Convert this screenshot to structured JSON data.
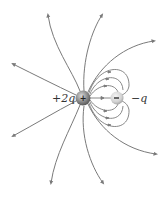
{
  "figure": {
    "type": "electric-field-lines",
    "charges": [
      {
        "id": "positive",
        "label": "+2q",
        "sign": "+",
        "x": 83,
        "y": 98,
        "r": 7.5
      },
      {
        "id": "negative",
        "label": "−q",
        "sign": "−",
        "x": 117,
        "y": 98,
        "r": 6.5
      }
    ],
    "colors": {
      "line": "#7a7a7a",
      "positive_charge": "#8a8a8a",
      "negative_charge": "#d4d4d4",
      "label": "#333333"
    }
  },
  "labels": {
    "positive": "+2q",
    "negative": "−q"
  },
  "caption": {
    "text": ""
  }
}
